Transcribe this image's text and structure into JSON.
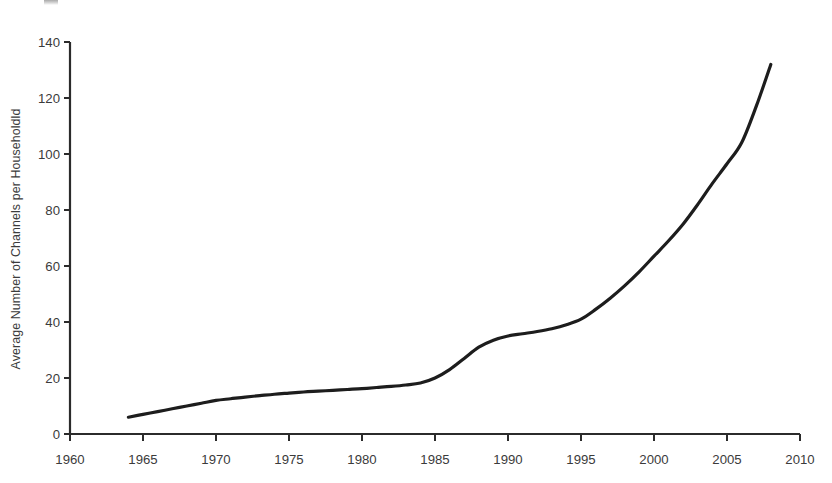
{
  "figure": {
    "background": "#ffffff",
    "line_color": "#1d1d1d",
    "text_color": "#3b3b3b",
    "axis_color": "#2b2b2b"
  },
  "chart_data": {
    "type": "line",
    "title": "",
    "subtitle": "",
    "xlabel": "",
    "ylabel": "Average Number of Channels per Householdld",
    "xlim": [
      1960,
      2010
    ],
    "ylim": [
      0,
      140
    ],
    "xticks": [
      1960,
      1965,
      1970,
      1975,
      1980,
      1985,
      1990,
      1995,
      2000,
      2005,
      2010
    ],
    "yticks": [
      0,
      20,
      40,
      60,
      80,
      100,
      120,
      140
    ],
    "xtick_labels": [
      "1960",
      "1965",
      "1970",
      "1975",
      "1980",
      "1985",
      "1990",
      "1995",
      "2000",
      "2005",
      "2010"
    ],
    "ytick_labels": [
      "0",
      "20",
      "40",
      "60",
      "80",
      "100",
      "120",
      "140"
    ],
    "grid": false,
    "legend": null,
    "legend_position": "none",
    "annotations": [],
    "series": [
      {
        "name": "Average Number of Channels per Household",
        "color": "#1d1d1d",
        "line_width": 3.2,
        "marker": "none",
        "x": [
          1964,
          1965,
          1966,
          1967,
          1968,
          1969,
          1970,
          1971,
          1972,
          1973,
          1974,
          1975,
          1976,
          1977,
          1978,
          1979,
          1980,
          1981,
          1982,
          1983,
          1984,
          1985,
          1986,
          1987,
          1988,
          1989,
          1990,
          1991,
          1992,
          1993,
          1994,
          1995,
          1996,
          1997,
          1998,
          1999,
          2000,
          2001,
          2002,
          2003,
          2004,
          2005,
          2006,
          2007,
          2008
        ],
        "y": [
          6,
          7,
          8,
          9,
          10,
          11,
          12,
          12.6,
          13.2,
          13.7,
          14.2,
          14.6,
          15,
          15.3,
          15.6,
          15.9,
          16.2,
          16.6,
          17,
          17.5,
          18.2,
          20,
          23,
          27,
          31,
          33.5,
          35,
          35.8,
          36.6,
          37.6,
          39,
          41,
          44.5,
          48.5,
          53,
          58,
          63.5,
          69,
          75,
          82,
          89.5,
          96.5,
          104,
          117,
          132
        ]
      }
    ]
  }
}
